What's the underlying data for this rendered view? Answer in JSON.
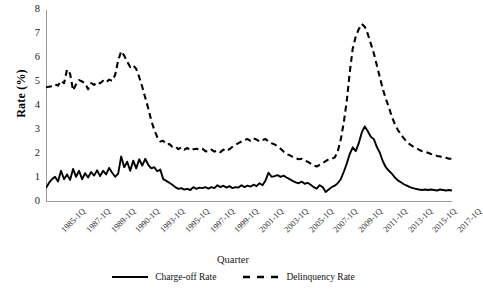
{
  "chart_data": {
    "type": "line",
    "title": "",
    "xlabel": "Quarter",
    "ylabel": "Rate (%)",
    "ylim": [
      0,
      8
    ],
    "yticks": [
      0,
      1,
      2,
      3,
      4,
      5,
      6,
      7,
      8
    ],
    "grid": false,
    "legend_position": "bottom",
    "x_tick_labels": [
      "1985-1Q",
      "1987-1Q",
      "1989-1Q",
      "1990-1Q",
      "1993-1Q",
      "1995-1Q",
      "1997-1Q",
      "1999-1Q",
      "2001-1Q",
      "2003-1Q",
      "2005-1Q",
      "2007-1Q",
      "2009-1Q",
      "2011-1Q",
      "2013-1Q",
      "2015-1Q",
      "2017-1Q"
    ],
    "x_start_year": 1985,
    "x_end_year": 2018,
    "series": [
      {
        "name": "Charge-off Rate",
        "style": "solid",
        "color": "#000000",
        "values": [
          0.58,
          0.8,
          0.95,
          1.05,
          0.85,
          1.3,
          0.95,
          1.15,
          0.92,
          1.38,
          1.05,
          1.3,
          0.95,
          1.2,
          1.02,
          1.25,
          1.1,
          1.32,
          1.08,
          1.3,
          1.15,
          1.42,
          1.22,
          1.05,
          1.18,
          1.9,
          1.45,
          1.68,
          1.3,
          1.72,
          1.4,
          1.78,
          1.52,
          1.8,
          1.55,
          1.4,
          1.45,
          1.28,
          1.35,
          0.95,
          0.88,
          0.8,
          0.72,
          0.62,
          0.55,
          0.58,
          0.52,
          0.55,
          0.5,
          0.62,
          0.55,
          0.6,
          0.58,
          0.62,
          0.56,
          0.62,
          0.58,
          0.7,
          0.62,
          0.68,
          0.6,
          0.66,
          0.58,
          0.62,
          0.6,
          0.7,
          0.62,
          0.68,
          0.64,
          0.72,
          0.66,
          0.78,
          0.7,
          0.9,
          1.22,
          1.05,
          1.08,
          1.12,
          1.05,
          1.1,
          1.02,
          0.95,
          0.88,
          0.82,
          0.78,
          0.85,
          0.76,
          0.8,
          0.72,
          0.62,
          0.56,
          0.7,
          0.62,
          0.42,
          0.52,
          0.62,
          0.68,
          0.78,
          0.95,
          1.25,
          1.6,
          2.0,
          2.28,
          2.12,
          2.45,
          2.9,
          3.15,
          2.95,
          2.72,
          2.62,
          2.3,
          2.05,
          1.7,
          1.45,
          1.3,
          1.18,
          1.02,
          0.9,
          0.82,
          0.74,
          0.68,
          0.62,
          0.58,
          0.55,
          0.52,
          0.5,
          0.52,
          0.5,
          0.52,
          0.5,
          0.48,
          0.52,
          0.5,
          0.48,
          0.5,
          0.48
        ]
      },
      {
        "name": "Delinquency Rate",
        "style": "dashed",
        "color": "#000000",
        "values": [
          4.78,
          4.8,
          4.82,
          4.9,
          4.85,
          5.05,
          4.95,
          5.52,
          5.35,
          4.65,
          4.9,
          5.08,
          5.02,
          4.95,
          4.7,
          4.95,
          4.88,
          5.0,
          4.95,
          5.05,
          4.98,
          5.1,
          5.05,
          5.3,
          5.9,
          6.28,
          6.1,
          5.85,
          5.62,
          5.7,
          5.55,
          5.2,
          4.8,
          4.35,
          3.9,
          3.4,
          3.0,
          2.7,
          2.52,
          2.55,
          2.4,
          2.42,
          2.3,
          2.32,
          2.2,
          2.28,
          2.18,
          2.25,
          2.15,
          2.2,
          2.22,
          2.18,
          2.22,
          2.12,
          2.1,
          2.18,
          2.1,
          2.15,
          2.08,
          2.18,
          2.12,
          2.2,
          2.3,
          2.38,
          2.45,
          2.52,
          2.58,
          2.62,
          2.55,
          2.65,
          2.6,
          2.52,
          2.58,
          2.62,
          2.52,
          2.45,
          2.4,
          2.32,
          2.22,
          2.1,
          2.0,
          1.95,
          1.88,
          1.82,
          1.78,
          1.8,
          1.72,
          1.68,
          1.6,
          1.52,
          1.48,
          1.55,
          1.62,
          1.7,
          1.78,
          1.8,
          1.85,
          2.1,
          2.6,
          3.3,
          4.2,
          5.4,
          6.4,
          6.9,
          7.2,
          7.42,
          7.3,
          7.0,
          6.6,
          6.2,
          5.7,
          5.2,
          4.7,
          4.3,
          3.95,
          3.55,
          3.25,
          3.0,
          2.82,
          2.65,
          2.5,
          2.4,
          2.32,
          2.25,
          2.18,
          2.12,
          2.1,
          2.05,
          2.0,
          1.98,
          1.92,
          1.9,
          1.86,
          1.84,
          1.8,
          1.8
        ]
      }
    ]
  },
  "legend": {
    "items": [
      {
        "label": "Charge-off Rate",
        "style": "solid"
      },
      {
        "label": "Delinquency Rate",
        "style": "dashed"
      }
    ]
  }
}
